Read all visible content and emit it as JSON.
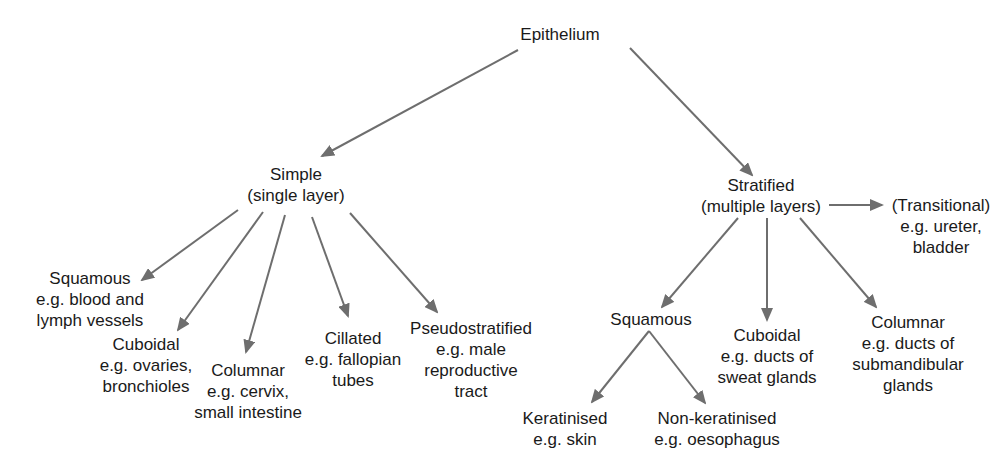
{
  "diagram": {
    "title": "Epithelium",
    "colors": {
      "arrow": "#6e6e6e",
      "text": "#1a1a1a",
      "background": "#ffffff"
    },
    "nodes": {
      "root": {
        "lines": [
          "Epithelium"
        ]
      },
      "simple": {
        "lines": [
          "Simple",
          "(single layer)"
        ]
      },
      "stratified": {
        "lines": [
          "Stratified",
          "(multiple layers)"
        ]
      },
      "transitional": {
        "lines": [
          "(Transitional)",
          "e.g. ureter,",
          "bladder"
        ]
      },
      "simple_squamous": {
        "lines": [
          "Squamous",
          "e.g. blood and",
          "lymph vessels"
        ]
      },
      "simple_cuboidal": {
        "lines": [
          "Cuboidal",
          "e.g. ovaries,",
          "bronchioles"
        ]
      },
      "simple_columnar": {
        "lines": [
          "Columnar",
          "e.g. cervix,",
          "small intestine"
        ]
      },
      "simple_cillated": {
        "lines": [
          "Cillated",
          "e.g. fallopian",
          "tubes"
        ]
      },
      "simple_pseudostratified": {
        "lines": [
          "Pseudostratified",
          "e.g. male",
          "reproductive",
          "tract"
        ]
      },
      "stratified_squamous": {
        "lines": [
          "Squamous"
        ]
      },
      "stratified_cuboidal": {
        "lines": [
          "Cuboidal",
          "e.g. ducts of",
          "sweat glands"
        ]
      },
      "stratified_columnar": {
        "lines": [
          "Columnar",
          "e.g. ducts of",
          "submandibular",
          "glands"
        ]
      },
      "keratinised": {
        "lines": [
          "Keratinised",
          "e.g. skin"
        ]
      },
      "non_keratinised": {
        "lines": [
          "Non-keratinised",
          "e.g. oesophagus"
        ]
      }
    },
    "edges": [
      {
        "from": "root",
        "to": "simple"
      },
      {
        "from": "root",
        "to": "stratified"
      },
      {
        "from": "stratified",
        "to": "transitional"
      },
      {
        "from": "simple",
        "to": "simple_squamous"
      },
      {
        "from": "simple",
        "to": "simple_cuboidal"
      },
      {
        "from": "simple",
        "to": "simple_columnar"
      },
      {
        "from": "simple",
        "to": "simple_cillated"
      },
      {
        "from": "simple",
        "to": "simple_pseudostratified"
      },
      {
        "from": "stratified",
        "to": "stratified_squamous"
      },
      {
        "from": "stratified",
        "to": "stratified_cuboidal"
      },
      {
        "from": "stratified",
        "to": "stratified_columnar"
      },
      {
        "from": "stratified_squamous",
        "to": "keratinised"
      },
      {
        "from": "stratified_squamous",
        "to": "non_keratinised"
      }
    ]
  }
}
